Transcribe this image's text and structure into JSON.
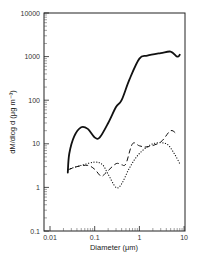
{
  "chart_data": {
    "type": "line",
    "title": "",
    "xlabel": "Diameter (μm)",
    "ylabel": "dM/dlog d  (μg m⁻³)",
    "xscale": "log",
    "yscale": "log",
    "xlim": [
      0.01,
      10
    ],
    "ylim": [
      0.1,
      10000
    ],
    "x_tick_labels": [
      "0.01",
      "0.1",
      "1",
      "10"
    ],
    "y_tick_labels": [
      "0.1",
      "1",
      "10",
      "100",
      "1000",
      "10000"
    ],
    "grid": false,
    "legend": null,
    "series": [
      {
        "name": "solid",
        "style": "solid",
        "x": [
          0.025,
          0.027,
          0.035,
          0.05,
          0.07,
          0.1,
          0.13,
          0.2,
          0.3,
          0.4,
          0.6,
          1.0,
          1.5,
          3.0,
          5.0,
          7.0,
          8.0
        ],
        "y": [
          2.2,
          6,
          15,
          24,
          22,
          14,
          14,
          30,
          70,
          100,
          300,
          900,
          1050,
          1200,
          1300,
          1000,
          1100
        ]
      },
      {
        "name": "dashed",
        "style": "dashed",
        "x": [
          0.025,
          0.04,
          0.07,
          0.1,
          0.14,
          0.18,
          0.3,
          0.4,
          0.5,
          0.7,
          1.0,
          1.5,
          3.0,
          5.0,
          7.0
        ],
        "y": [
          2.5,
          3.0,
          3.2,
          2.6,
          1.8,
          2.2,
          3.5,
          3.3,
          3.5,
          10,
          9,
          8.5,
          11,
          20,
          16
        ]
      },
      {
        "name": "dotted",
        "style": "dotted",
        "x": [
          0.025,
          0.05,
          0.1,
          0.15,
          0.2,
          0.3,
          0.4,
          0.6,
          1.0,
          2.0,
          4.0,
          6.0,
          8.0
        ],
        "y": [
          2.6,
          3.2,
          3.8,
          3.3,
          2.0,
          1.0,
          1.2,
          2.8,
          6,
          10,
          10,
          6,
          3.5
        ]
      }
    ]
  },
  "labels": {
    "xlabel": "Diameter (μm)",
    "ylabel": "dM/dlog d  (μg m⁻³)"
  }
}
